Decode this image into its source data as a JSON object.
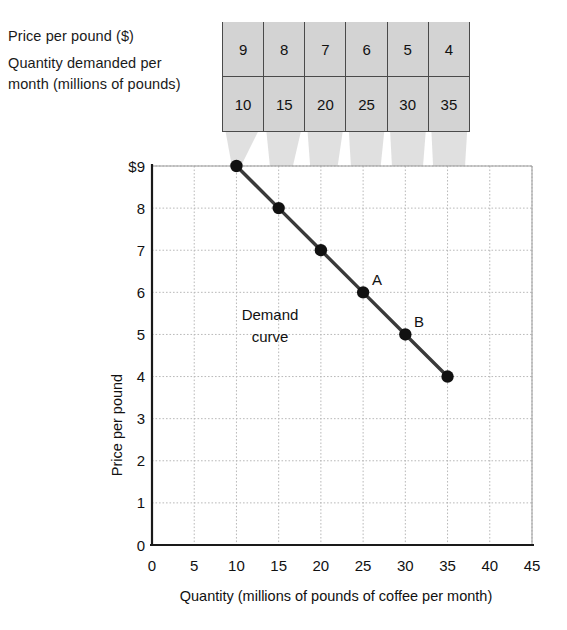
{
  "labels": {
    "price_row": "Price per pound ($)",
    "quantity_row_line1": "Quantity demanded per",
    "quantity_row_line2": "month (millions of pounds)"
  },
  "table": {
    "price_values": [
      "9",
      "8",
      "7",
      "6",
      "5",
      "4"
    ],
    "quantity_values": [
      "10",
      "15",
      "20",
      "25",
      "30",
      "35"
    ]
  },
  "chart_data": {
    "type": "line",
    "title": "",
    "xlabel": "Quantity (millions of pounds of coffee per month)",
    "ylabel": "Price per pound",
    "x": [
      10,
      15,
      20,
      25,
      30,
      35
    ],
    "values": [
      9,
      8,
      7,
      6,
      5,
      4
    ],
    "series": [
      {
        "name": "Demand curve",
        "x": [
          10,
          15,
          20,
          25,
          30,
          35
        ],
        "values": [
          9,
          8,
          7,
          6,
          5,
          4
        ]
      }
    ],
    "xlim": [
      0,
      45
    ],
    "ylim": [
      0,
      9
    ],
    "xticks": [
      "0",
      "5",
      "10",
      "15",
      "20",
      "25",
      "30",
      "35",
      "40",
      "45"
    ],
    "yticks": [
      "0",
      "1",
      "2",
      "3",
      "4",
      "5",
      "6",
      "7",
      "8",
      "$9"
    ],
    "grid": true,
    "legend": "none",
    "annotations": [
      {
        "text": "A",
        "x": 25,
        "y": 6
      },
      {
        "text": "B",
        "x": 30,
        "y": 5
      },
      {
        "text": "Demand curve",
        "x": 20.5,
        "y": 5.9
      }
    ],
    "curve_label_line1": "Demand",
    "curve_label_line2": "curve",
    "point_a_label": "A",
    "point_b_label": "B"
  },
  "colors": {
    "table_fill": "#d3d3d3",
    "table_border": "#4a4a4a",
    "curve": "#3a3a3a",
    "dot": "#111111",
    "grid": "#b9b9b9",
    "axis": "#1a1a1a",
    "funnel": "#d8d8d8"
  }
}
